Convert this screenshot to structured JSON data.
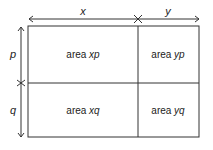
{
  "dimensions": {
    "top": [
      {
        "label": "x"
      },
      {
        "label": "y"
      }
    ],
    "left": [
      {
        "label": "p"
      },
      {
        "label": "q"
      }
    ]
  },
  "cells": [
    {
      "prefix": "area",
      "var": "xp"
    },
    {
      "prefix": "area",
      "var": "yp"
    },
    {
      "prefix": "area",
      "var": "xq"
    },
    {
      "prefix": "area",
      "var": "yq"
    }
  ],
  "colors": {
    "line": "#333333",
    "text": "#222222"
  }
}
